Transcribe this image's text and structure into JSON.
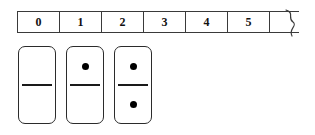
{
  "figure": {
    "background_color": "#ffffff",
    "line_color": "#3a3a3a",
    "pip_color": "#000000"
  },
  "number_strip": {
    "name": "number-strip",
    "continues": true,
    "continuation_marker": "wavy-torn-edge",
    "cells": [
      {
        "label": "0"
      },
      {
        "label": "1"
      },
      {
        "label": "2"
      },
      {
        "label": "3"
      },
      {
        "label": "4"
      },
      {
        "label": "5"
      }
    ]
  },
  "dominoes": [
    {
      "name": "domino-0-0",
      "top_pips": 0,
      "bottom_pips": 0,
      "label": "0-0"
    },
    {
      "name": "domino-1-0",
      "top_pips": 1,
      "bottom_pips": 0,
      "label": "1-0"
    },
    {
      "name": "domino-1-1",
      "top_pips": 1,
      "bottom_pips": 1,
      "label": "1-1"
    }
  ]
}
